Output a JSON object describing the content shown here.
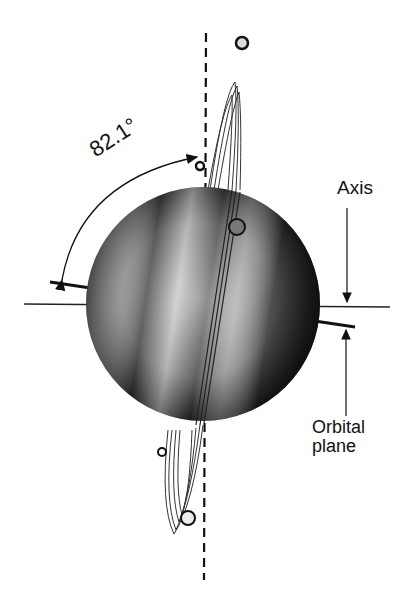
{
  "diagram": {
    "labels": {
      "angle": "82.1°",
      "axis": "Axis",
      "orbital_plane_line1": "Orbital",
      "orbital_plane_line2": "plane"
    },
    "colors": {
      "ink": "#111111",
      "background": "#ffffff",
      "planet_dark": "#1a1a1a",
      "planet_light": "#bdbdbd"
    }
  }
}
